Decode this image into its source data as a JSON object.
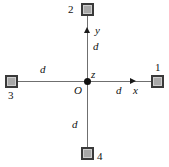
{
  "figure": {
    "origin_label": "O",
    "axes": {
      "x_label": "x",
      "y_label": "y",
      "z_label": "z"
    },
    "distance_labels": {
      "up": "d",
      "down": "d",
      "left": "d",
      "right": "d"
    },
    "charges": [
      {
        "id": "1",
        "label": "1",
        "position": "right"
      },
      {
        "id": "2",
        "label": "2",
        "position": "top"
      },
      {
        "id": "3",
        "label": "3",
        "position": "left"
      },
      {
        "id": "4",
        "label": "4",
        "position": "bottom"
      }
    ],
    "colors": {
      "square_fill": "#a9a9a9",
      "square_border": "#3a3a3a",
      "axis": "#6f6f6f",
      "ink": "#111111"
    }
  }
}
